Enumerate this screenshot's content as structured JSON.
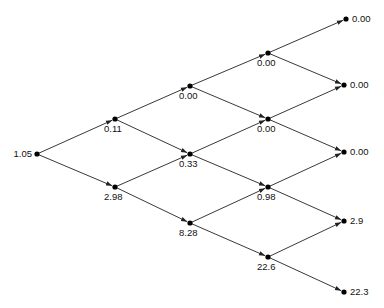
{
  "diagram": {
    "type": "binomial-tree",
    "levels": 5,
    "nodes": [
      {
        "id": "n0_0",
        "level": 0,
        "x": 37,
        "y": 154,
        "value": "1.05",
        "label_pos": "left"
      },
      {
        "id": "n1_0",
        "level": 1,
        "x": 115,
        "y": 119,
        "value": "0.11",
        "label_pos": "below"
      },
      {
        "id": "n1_1",
        "level": 1,
        "x": 115,
        "y": 187,
        "value": "2.98",
        "label_pos": "below"
      },
      {
        "id": "n2_0",
        "level": 2,
        "x": 190,
        "y": 86,
        "value": "0.00",
        "label_pos": "below"
      },
      {
        "id": "n2_1",
        "level": 2,
        "x": 190,
        "y": 154,
        "value": "0.33",
        "label_pos": "below"
      },
      {
        "id": "n2_2",
        "level": 2,
        "x": 190,
        "y": 223,
        "value": "8.28",
        "label_pos": "below"
      },
      {
        "id": "n3_0",
        "level": 3,
        "x": 268,
        "y": 53,
        "value": "0.00",
        "label_pos": "below"
      },
      {
        "id": "n3_1",
        "level": 3,
        "x": 268,
        "y": 119,
        "value": "0.00",
        "label_pos": "below"
      },
      {
        "id": "n3_2",
        "level": 3,
        "x": 268,
        "y": 187,
        "value": "0.98",
        "label_pos": "below"
      },
      {
        "id": "n3_3",
        "level": 3,
        "x": 268,
        "y": 257,
        "value": "22.6",
        "label_pos": "below"
      },
      {
        "id": "n4_0",
        "level": 4,
        "x": 346,
        "y": 19,
        "value": "0.00",
        "label_pos": "right"
      },
      {
        "id": "n4_1",
        "level": 4,
        "x": 344,
        "y": 85,
        "value": "0.00",
        "label_pos": "right"
      },
      {
        "id": "n4_2",
        "level": 4,
        "x": 344,
        "y": 152,
        "value": "0.00",
        "label_pos": "right"
      },
      {
        "id": "n4_3",
        "level": 4,
        "x": 344,
        "y": 221,
        "value": "2.9",
        "label_pos": "right"
      },
      {
        "id": "n4_4",
        "level": 4,
        "x": 344,
        "y": 292,
        "value": "22.3",
        "label_pos": "right"
      }
    ],
    "edges": [
      [
        "n0_0",
        "n1_0"
      ],
      [
        "n0_0",
        "n1_1"
      ],
      [
        "n1_0",
        "n2_0"
      ],
      [
        "n1_0",
        "n2_1"
      ],
      [
        "n1_1",
        "n2_1"
      ],
      [
        "n1_1",
        "n2_2"
      ],
      [
        "n2_0",
        "n3_0"
      ],
      [
        "n2_0",
        "n3_1"
      ],
      [
        "n2_1",
        "n3_1"
      ],
      [
        "n2_1",
        "n3_2"
      ],
      [
        "n2_2",
        "n3_2"
      ],
      [
        "n2_2",
        "n3_3"
      ],
      [
        "n3_0",
        "n4_0"
      ],
      [
        "n3_0",
        "n4_1"
      ],
      [
        "n3_1",
        "n4_1"
      ],
      [
        "n3_1",
        "n4_2"
      ],
      [
        "n3_2",
        "n4_2"
      ],
      [
        "n3_2",
        "n4_3"
      ],
      [
        "n3_3",
        "n4_3"
      ],
      [
        "n3_3",
        "n4_4"
      ]
    ],
    "colors": {
      "line": "#222222",
      "node": "#000000",
      "text": "#111111",
      "background": "#ffffff"
    }
  }
}
